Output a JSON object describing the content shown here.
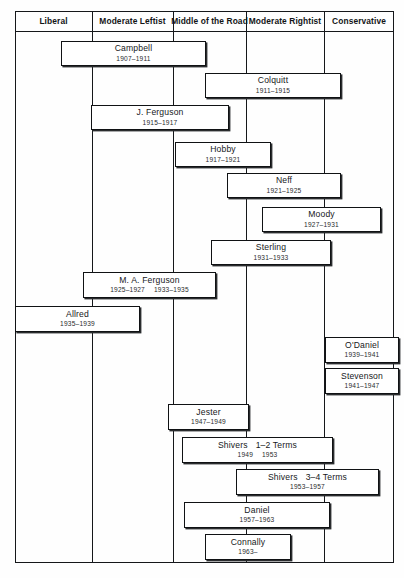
{
  "chart_data": {
    "type": "table",
    "xlabel": "Political position",
    "ylabel": "Time",
    "grid": true,
    "legend": "none",
    "categories": [
      "Liberal",
      "Moderate Leftist",
      "Middle of the Road",
      "Moderate Rightist",
      "Conservative"
    ],
    "column_x": [
      15,
      92,
      173,
      246,
      324,
      394
    ],
    "series": [
      {
        "name": "Campbell",
        "dates": "1907–1911",
        "start": 1907,
        "end": 1911,
        "span": [
          "Moderate Leftist",
          "Middle of the Road"
        ]
      },
      {
        "name": "Colquitt",
        "dates": "1911–1915",
        "start": 1911,
        "end": 1915,
        "span": [
          "Moderate Rightist"
        ]
      },
      {
        "name": "J. Ferguson",
        "dates": "1915–1917",
        "start": 1915,
        "end": 1917,
        "span": [
          "Moderate Leftist",
          "Middle of the Road"
        ]
      },
      {
        "name": "Hobby",
        "dates": "1917–1921",
        "start": 1917,
        "end": 1921,
        "span": [
          "Middle of the Road"
        ]
      },
      {
        "name": "Neff",
        "dates": "1921–1925",
        "start": 1921,
        "end": 1925,
        "span": [
          "Moderate Rightist"
        ]
      },
      {
        "name": "Moody",
        "dates": "1927–1931",
        "start": 1927,
        "end": 1931,
        "span": [
          "Moderate Rightist",
          "Conservative"
        ]
      },
      {
        "name": "Sterling",
        "dates": "1931–1933",
        "start": 1931,
        "end": 1933,
        "span": [
          "Middle of the Road",
          "Moderate Rightist"
        ]
      },
      {
        "name": "M. A. Ferguson",
        "dates": "1925–1927",
        "dates2": "1933–1935",
        "start": 1925,
        "end": 1935,
        "span": [
          "Moderate Leftist",
          "Middle of the Road"
        ]
      },
      {
        "name": "Allred",
        "dates": "1935–1939",
        "start": 1935,
        "end": 1939,
        "span": [
          "Liberal",
          "Moderate Leftist"
        ]
      },
      {
        "name": "O'Daniel",
        "dates": "1939–1941",
        "start": 1939,
        "end": 1941,
        "span": [
          "Conservative"
        ]
      },
      {
        "name": "Stevenson",
        "dates": "1941–1947",
        "start": 1941,
        "end": 1947,
        "span": [
          "Conservative"
        ]
      },
      {
        "name": "Jester",
        "dates": "1947–1949",
        "start": 1947,
        "end": 1949,
        "span": [
          "Middle of the Road"
        ]
      },
      {
        "name": "Shivers   1–2 Terms",
        "dates": "1949  1953",
        "start": 1949,
        "end": 1953,
        "span": [
          "Middle of the Road",
          "Moderate Rightist"
        ]
      },
      {
        "name": "Shivers   3–4 Terms",
        "dates": "1953–1957",
        "start": 1953,
        "end": 1957,
        "span": [
          "Moderate Rightist",
          "Conservative"
        ]
      },
      {
        "name": "Daniel",
        "dates": "1957–1963",
        "start": 1957,
        "end": 1963,
        "span": [
          "Middle of the Road",
          "Moderate Rightist"
        ]
      },
      {
        "name": "Connally",
        "dates": "1963–",
        "start": 1963,
        "end": null,
        "span": [
          "Middle of the Road"
        ]
      }
    ]
  },
  "header": {
    "columns": [
      {
        "label": "Liberal",
        "left": 15,
        "width": 77
      },
      {
        "label": "Moderate Leftist",
        "left": 92,
        "width": 81
      },
      {
        "label": "Middle of the Road",
        "left": 173,
        "width": 73
      },
      {
        "label": "Moderate Rightist",
        "left": 246,
        "width": 78
      },
      {
        "label": "Conservative",
        "left": 324,
        "width": 70
      }
    ]
  },
  "boxes": [
    {
      "key": "campbell",
      "name": "Campbell",
      "dates": "1907–1911",
      "left": 61,
      "top": 41,
      "width": 145,
      "height": 25
    },
    {
      "key": "colquitt",
      "name": "Colquitt",
      "dates": "1911–1915",
      "left": 205,
      "top": 73,
      "width": 136,
      "height": 25
    },
    {
      "key": "jferguson",
      "name": "J. Ferguson",
      "dates": "1915–1917",
      "left": 91,
      "top": 105,
      "width": 138,
      "height": 25
    },
    {
      "key": "hobby",
      "name": "Hobby",
      "dates": "1917–1921",
      "left": 175,
      "top": 142,
      "width": 96,
      "height": 25
    },
    {
      "key": "neff",
      "name": "Neff",
      "dates": "1921–1925",
      "left": 227,
      "top": 173,
      "width": 114,
      "height": 25
    },
    {
      "key": "moody",
      "name": "Moody",
      "dates": "1927–1931",
      "left": 262,
      "top": 207,
      "width": 119,
      "height": 25
    },
    {
      "key": "sterling",
      "name": "Sterling",
      "dates": "1931–1933",
      "left": 211,
      "top": 240,
      "width": 120,
      "height": 25
    },
    {
      "key": "maferguson",
      "name": "M. A. Ferguson",
      "dates": "1925–1927",
      "dates2": "1933–1935",
      "left": 83,
      "top": 272,
      "width": 133,
      "height": 26
    },
    {
      "key": "allred",
      "name": "Allred",
      "dates": "1935–1939",
      "left": 15,
      "top": 306,
      "width": 125,
      "height": 26
    },
    {
      "key": "odaniel",
      "name": "O'Daniel",
      "dates": "1939–1941",
      "left": 325,
      "top": 337,
      "width": 74,
      "height": 26
    },
    {
      "key": "stevenson",
      "name": "Stevenson",
      "dates": "1941–1947",
      "left": 325,
      "top": 368,
      "width": 74,
      "height": 26
    },
    {
      "key": "jester",
      "name": "Jester",
      "dates": "1947–1949",
      "left": 168,
      "top": 404,
      "width": 81,
      "height": 26
    },
    {
      "key": "shivers12",
      "name": "Shivers",
      "name2": "1–2 Terms",
      "dates": "1949",
      "dates2": "1953",
      "left": 182,
      "top": 437,
      "width": 151,
      "height": 26
    },
    {
      "key": "shivers34",
      "name": "Shivers",
      "name2": "3–4 Terms",
      "dates": "1953–1957",
      "left": 236,
      "top": 469,
      "width": 143,
      "height": 26
    },
    {
      "key": "daniel",
      "name": "Daniel",
      "dates": "1957–1963",
      "left": 184,
      "top": 502,
      "width": 146,
      "height": 26
    },
    {
      "key": "connally",
      "name": "Connally",
      "dates": "1963–",
      "left": 205,
      "top": 534,
      "width": 86,
      "height": 26
    }
  ]
}
